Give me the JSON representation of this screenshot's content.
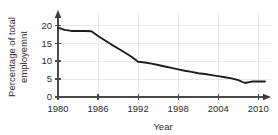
{
  "chart_data": {
    "type": "line",
    "title": "",
    "subtitle": "",
    "xlabel": "Year",
    "ylabel": "Percentage of total employemnt",
    "ylabel_lines": [
      "Percentage of total",
      "employemnt"
    ],
    "xlim": [
      1980,
      2011
    ],
    "ylim": [
      0,
      22
    ],
    "xticks": [
      1980,
      1986,
      1992,
      1998,
      2004,
      2010
    ],
    "xticklabels": [
      "1980",
      "1986",
      "1992",
      "1998",
      "2004",
      "2010"
    ],
    "yticks": [
      0,
      5,
      10,
      15,
      20
    ],
    "yticklabels": [
      "0",
      "5",
      "10",
      "15",
      "20"
    ],
    "grid": true,
    "legend": false,
    "legend_position": "none",
    "line_color": "#1d1d1d",
    "grid_color": "#e9e9e9",
    "axis_color": "#4a4a4a",
    "background_color": "#ffffff",
    "x": [
      1980,
      1981,
      1982,
      1983,
      1984,
      1985,
      1986,
      1987,
      1988,
      1989,
      1990,
      1991,
      1992,
      1993,
      1994,
      1995,
      1996,
      1997,
      1998,
      1999,
      2000,
      2001,
      2002,
      2003,
      2004,
      2005,
      2006,
      2007,
      2008,
      2009,
      2010,
      2011
    ],
    "values": [
      19.3,
      18.7,
      18.4,
      18.4,
      18.4,
      18.3,
      17.0,
      15.8,
      14.6,
      13.5,
      12.4,
      11.2,
      9.8,
      9.6,
      9.3,
      8.9,
      8.5,
      8.1,
      7.7,
      7.3,
      7.0,
      6.6,
      6.4,
      6.1,
      5.8,
      5.5,
      5.2,
      4.7,
      3.9,
      4.3,
      4.3,
      4.3
    ],
    "series": [
      {
        "name": "Percentage of total employemnt",
        "values": [
          19.3,
          18.7,
          18.4,
          18.4,
          18.4,
          18.3,
          17.0,
          15.8,
          14.6,
          13.5,
          12.4,
          11.2,
          9.8,
          9.6,
          9.3,
          8.9,
          8.5,
          8.1,
          7.7,
          7.3,
          7.0,
          6.6,
          6.4,
          6.1,
          5.8,
          5.5,
          5.2,
          4.7,
          3.9,
          4.3,
          4.3,
          4.3
        ]
      }
    ],
    "annotations": []
  }
}
